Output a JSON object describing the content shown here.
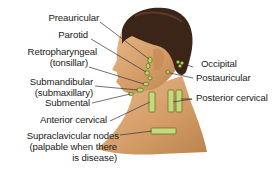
{
  "diagram": {
    "colors": {
      "background": "#ffffff",
      "skin": "#d9a572",
      "skin_shadow": "#b9834f",
      "hair": "#3a2518",
      "node_fill": "#b8d86a",
      "node_outline": "#5a6a20",
      "leader_line": "#333333",
      "label_text": "#1a1a1a"
    },
    "labels": {
      "preauricular": "Preauricular",
      "parotid": "Parotid",
      "retropharyngeal_1": "Retropharyngeal",
      "retropharyngeal_2": "(tonsillar)",
      "submandibular_1": "Submandibular",
      "submandibular_2": "(submaxillary)",
      "submental": "Submental",
      "anterior_cervical": "Anterior cervical",
      "supraclavicular_1": "Supraclavicular nodes",
      "supraclavicular_2": "(palpable when there",
      "supraclavicular_3": "is disease)",
      "occipital": "Occipital",
      "postauricular": "Postauricular",
      "posterior_cervical": "Posterior cervical"
    }
  }
}
